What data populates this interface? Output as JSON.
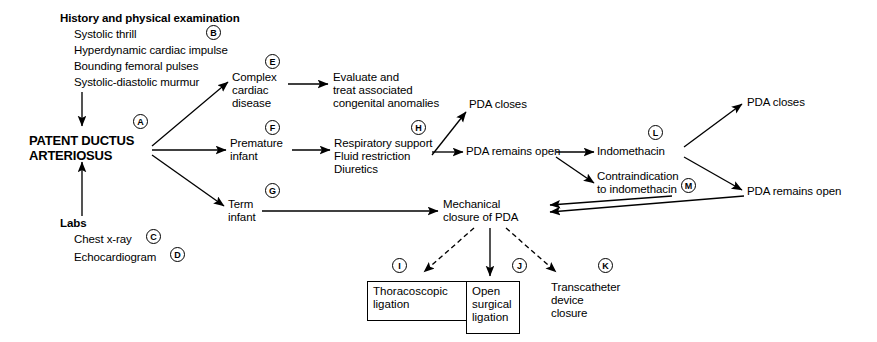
{
  "diagram": {
    "line_color": "#000000",
    "background": "#ffffff"
  },
  "sections": {
    "history_heading": "History and physical examination",
    "history_items": [
      "Systolic thrill",
      "Hyperdynamic cardiac impulse",
      "Bounding femoral pulses",
      "Systolic-diastolic murmur"
    ],
    "labs_heading": "Labs",
    "labs_items": [
      "Chest x-ray",
      "Echocardiogram"
    ]
  },
  "nodes": {
    "central": "PATENT DUCTUS\nARTERIOSUS",
    "complex_cardiac": "Complex\ncardiac\ndisease",
    "evaluate_treat": "Evaluate and\ntreat associated\ncongenital anomalies",
    "premature_infant": "Premature\ninfant",
    "respiratory_support": "Respiratory support\nFluid restriction\nDiuretics",
    "term_infant": "Term\ninfant",
    "pda_closes_mid": "PDA closes",
    "pda_remains_open_mid": "PDA remains open",
    "indomethacin": "Indomethacin",
    "contraindication": "Contraindication\nto indomethacin",
    "pda_closes_right": "PDA closes",
    "pda_remains_open_right": "PDA remains open",
    "mechanical_closure": "Mechanical\nclosure of PDA",
    "thoracoscopic_ligation": "Thoracoscopic\nligation",
    "open_surgical_ligation": "Open\nsurgical\nligation",
    "transcatheter_closure": "Transcatheter\ndevice\nclosure"
  },
  "markers": {
    "a": "A",
    "b": "B",
    "c": "C",
    "d": "D",
    "e": "E",
    "f": "F",
    "g": "G",
    "h": "H",
    "i": "I",
    "j": "J",
    "k": "K",
    "l": "L",
    "m": "M"
  }
}
